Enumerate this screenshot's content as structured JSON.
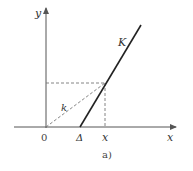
{
  "diagram": {
    "caption": "a)",
    "axes": {
      "x_label": "x",
      "y_label": "y",
      "origin_label": "0"
    },
    "tick_labels": {
      "delta": "Δ",
      "x_point": "x"
    },
    "lines": {
      "main_line_label": "K",
      "dashed_line_label": "k"
    },
    "colors": {
      "axis": "#555555",
      "main_line": "#222222",
      "dashed": "#777777",
      "text": "#333333"
    }
  }
}
